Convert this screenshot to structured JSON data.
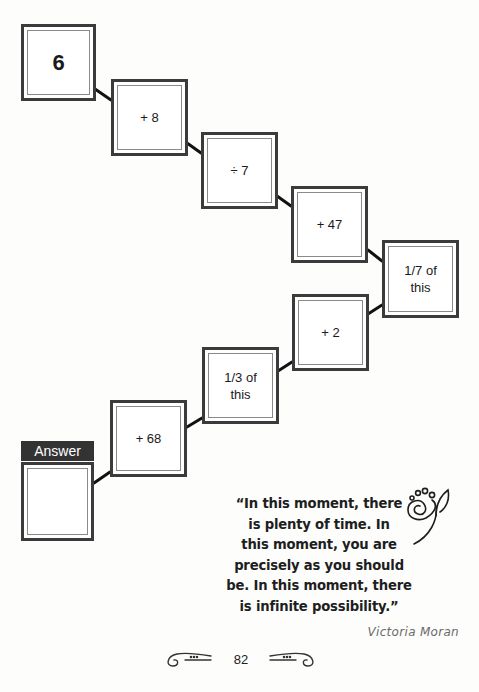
{
  "puzzle": {
    "start": {
      "label": "6"
    },
    "steps": [
      {
        "label": "+ 8"
      },
      {
        "label": "÷ 7"
      },
      {
        "label": "+ 47"
      },
      {
        "label": "1/7 of this"
      },
      {
        "label": "+ 2"
      },
      {
        "label": "1/3 of this"
      },
      {
        "label": "+ 68"
      }
    ],
    "answer": {
      "label": "Answer",
      "value": ""
    }
  },
  "quote": {
    "text": "“In this moment, there is plenty of time. In this moment, you are precisely as you should be. In this moment, there is infinite possibility.”",
    "lines": [
      "“In this moment, there",
      "is plenty of time. In",
      "this moment, you are",
      "precisely as you should",
      "be. In this moment, there",
      "is infinite possibility.”"
    ],
    "author": "Victoria Moran"
  },
  "footer": {
    "page_number": "82"
  },
  "colors": {
    "box_border": "#3b3b3b",
    "inner_border": "#8a8a8a",
    "answer_bar": "#333333"
  }
}
